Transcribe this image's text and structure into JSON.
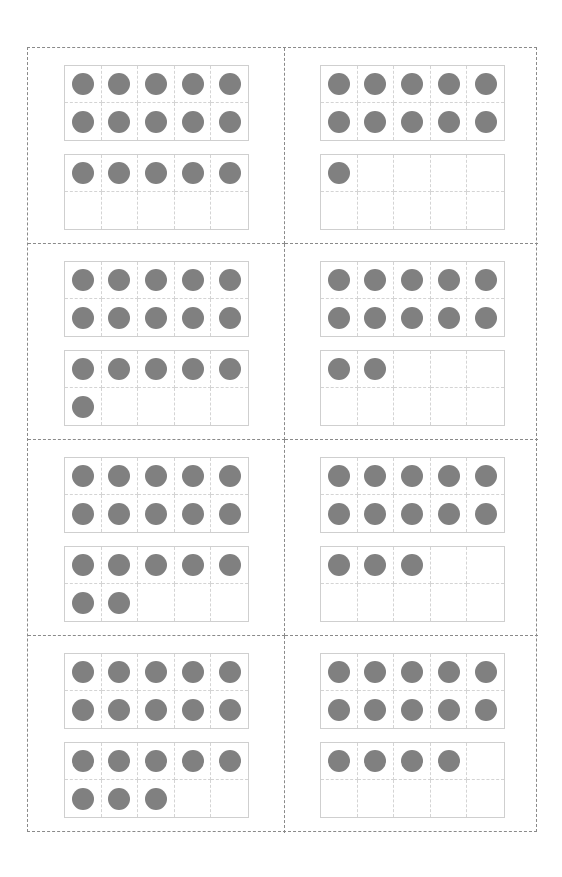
{
  "worksheet": {
    "title": "",
    "dot_color": "#808080",
    "cards": [
      {
        "number": 15,
        "frames": [
          10,
          5
        ]
      },
      {
        "number": 11,
        "frames": [
          10,
          1
        ]
      },
      {
        "number": 16,
        "frames": [
          10,
          6
        ]
      },
      {
        "number": 12,
        "frames": [
          10,
          2
        ]
      },
      {
        "number": 17,
        "frames": [
          10,
          7
        ]
      },
      {
        "number": 13,
        "frames": [
          10,
          3
        ]
      },
      {
        "number": 18,
        "frames": [
          10,
          8
        ]
      },
      {
        "number": 14,
        "frames": [
          10,
          4
        ]
      }
    ]
  }
}
